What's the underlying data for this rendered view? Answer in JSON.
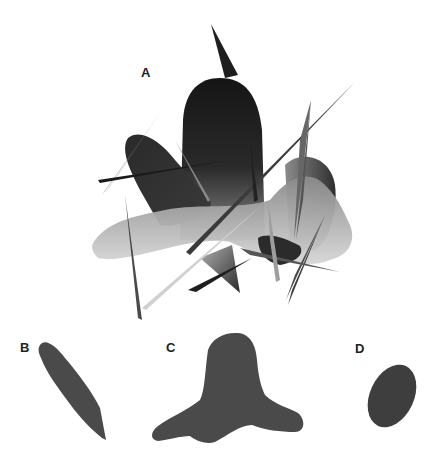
{
  "figure": {
    "panels": [
      {
        "id": "A",
        "label": "A",
        "description": "Composite cluttered scene of overlapping shapes and spikes"
      },
      {
        "id": "B",
        "label": "B",
        "description": "Elongated diagonal leaf-like shape"
      },
      {
        "id": "C",
        "label": "C",
        "description": "Three-lobed blob shape"
      },
      {
        "id": "D",
        "label": "D",
        "description": "Tilted oval shape"
      }
    ],
    "colors": {
      "shape_fill": "#4a4a4a",
      "dark": "#1c1c1c",
      "mid": "#6e6e6e",
      "light": "#bdbdbd",
      "background": "#ffffff"
    }
  }
}
